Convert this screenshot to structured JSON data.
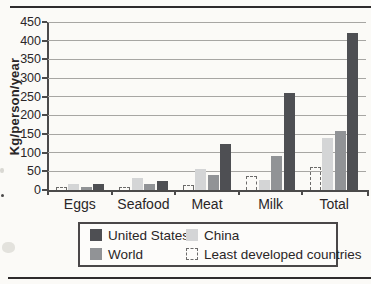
{
  "page": {
    "background": "#fbfaf7"
  },
  "chart_data": {
    "type": "bar",
    "title": "",
    "xlabel": "",
    "ylabel": "Kg/person/year",
    "ylim": [
      0,
      450
    ],
    "yticks": [
      0,
      50,
      100,
      150,
      200,
      250,
      300,
      350,
      400,
      450
    ],
    "grid": true,
    "categories": [
      "Eggs",
      "Seafood",
      "Meat",
      "Milk",
      "Total"
    ],
    "series": [
      {
        "name": "Least developed countries",
        "style": "dashed",
        "color": "#fbfaf7",
        "border": "#6c6b6a",
        "values": [
          2,
          9,
          13,
          38,
          62
        ]
      },
      {
        "name": "China",
        "style": "fill",
        "color": "#d4d5d6",
        "values": [
          17,
          32,
          57,
          28,
          140
        ]
      },
      {
        "name": "World",
        "style": "fill",
        "color": "#919396",
        "values": [
          9,
          17,
          40,
          90,
          158
        ]
      },
      {
        "name": "United States",
        "style": "fill",
        "color": "#4e4f53",
        "values": [
          15,
          25,
          122,
          260,
          420
        ]
      }
    ],
    "legend": {
      "position": "bottom",
      "items": [
        {
          "label": "United States",
          "swatch": "#4e4f53",
          "style": "fill"
        },
        {
          "label": "China",
          "swatch": "#d4d5d6",
          "style": "fill"
        },
        {
          "label": "World",
          "swatch": "#919396",
          "style": "fill"
        },
        {
          "label": "Least developed countries",
          "swatch": "#fbfaf7",
          "style": "dashed"
        }
      ]
    }
  }
}
